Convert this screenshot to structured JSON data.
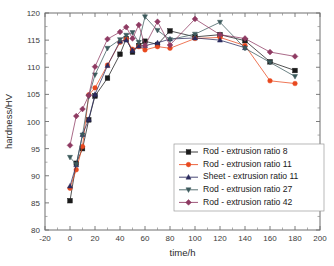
{
  "chart_data": {
    "type": "line",
    "title": "",
    "xlabel": "time/h",
    "ylabel": "hardness/HV",
    "xlim": [
      -20,
      200
    ],
    "ylim": [
      80,
      120
    ],
    "xticks": [
      -20,
      0,
      20,
      40,
      60,
      80,
      100,
      120,
      140,
      160,
      180,
      200
    ],
    "yticks": [
      80,
      85,
      90,
      95,
      100,
      105,
      110,
      115,
      120
    ],
    "xtick_labels": [
      "-20",
      "0",
      "20",
      "40",
      "60",
      "80",
      "100",
      "120",
      "140",
      "160",
      "180",
      "200"
    ],
    "ytick_labels": [
      "80",
      "85",
      "90",
      "95",
      "100",
      "105",
      "110",
      "115",
      "120"
    ],
    "grid": false,
    "minor_ticks": true,
    "legend_position": "center-right",
    "series": [
      {
        "name": "Rod - extrusion ratio 8",
        "color": "#1a1a1a",
        "marker": "square",
        "x": [
          0,
          5,
          10,
          15,
          20,
          30,
          40,
          45,
          50,
          55,
          60,
          70,
          80,
          100,
          120,
          140,
          160,
          180
        ],
        "y": [
          85.4,
          92.3,
          95.0,
          100.3,
          104.7,
          108.0,
          112.4,
          115.3,
          112.8,
          114.0,
          114.8,
          114.2,
          116.7,
          115.6,
          116.0,
          114.9,
          111.0,
          109.4
        ]
      },
      {
        "name": "Rod - extrusion ratio 11",
        "color": "#e8491f",
        "marker": "circle",
        "x": [
          0,
          5,
          10,
          15,
          20,
          30,
          40,
          45,
          50,
          55,
          60,
          70,
          80,
          100,
          120,
          140,
          160,
          180
        ],
        "y": [
          87.7,
          91.1,
          95.4,
          104.9,
          106.2,
          110.4,
          114.6,
          115.2,
          113.3,
          113.8,
          113.2,
          113.8,
          113.5,
          115.3,
          115.5,
          114.0,
          107.5,
          107.0
        ]
      },
      {
        "name": "Sheet - extrusion ratio 11",
        "color": "#2b2b5e",
        "marker": "triangle-up",
        "x": [
          0,
          5,
          10,
          15,
          20,
          30,
          40,
          45,
          50,
          55,
          60,
          70,
          80,
          100,
          120,
          140
        ],
        "y": [
          88.1,
          92.0,
          97.6,
          100.4,
          105.0,
          110.3,
          114.8,
          115.0,
          113.1,
          113.9,
          114.0,
          114.5,
          115.2,
          115.4,
          115.0,
          113.6
        ]
      },
      {
        "name": "Rod - extrusion ratio 27",
        "color": "#3c5a5c",
        "marker": "triangle-down",
        "x": [
          0,
          5,
          10,
          15,
          20,
          30,
          40,
          45,
          50,
          55,
          60,
          70,
          80,
          100,
          120,
          140,
          160,
          180
        ],
        "y": [
          93.4,
          92.1,
          97.5,
          104.6,
          108.6,
          113.5,
          115.1,
          115.9,
          116.4,
          114.6,
          119.3,
          116.8,
          115.1,
          116.1,
          118.3,
          113.5,
          110.9,
          108.3
        ]
      },
      {
        "name": "Rod - extrusion ratio 42",
        "color": "#8e3a62",
        "marker": "diamond",
        "x": [
          0,
          5,
          10,
          15,
          20,
          30,
          40,
          45,
          50,
          55,
          60,
          70,
          80,
          100,
          120,
          140,
          160,
          180
        ],
        "y": [
          95.6,
          101.0,
          102.3,
          104.8,
          110.1,
          115.2,
          116.5,
          117.4,
          115.3,
          117.8,
          114.0,
          118.4,
          114.1,
          118.9,
          116.0,
          115.3,
          112.8,
          112.0
        ]
      }
    ]
  }
}
